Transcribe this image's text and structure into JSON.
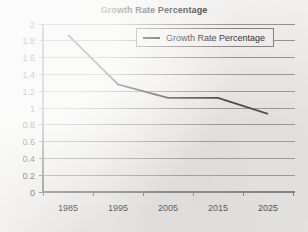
{
  "chart_data": {
    "type": "line",
    "title": "Growth Rate Percentage",
    "xlabel": "",
    "ylabel": "",
    "categories": [
      "1985",
      "1995",
      "2005",
      "2015",
      "2025"
    ],
    "series": [
      {
        "name": "Growth Rate Percentage",
        "values": [
          1.87,
          1.28,
          1.12,
          1.12,
          0.93
        ],
        "color": "#2a2a2a"
      }
    ],
    "ylim": [
      0,
      2
    ],
    "y_ticks": [
      "0",
      "0.2",
      "0.4",
      "0.6",
      "0.8",
      "1",
      "1.2",
      "1.4",
      "1.6",
      "1.8",
      "2"
    ],
    "grid": true,
    "legend": {
      "position": "top-center-inside",
      "entries": [
        {
          "label": "Growth Rate Percentage",
          "marker": "line-swatch"
        }
      ]
    },
    "colors": {
      "background": "#f1f0ee",
      "gridline": "#8f8f8f",
      "axis": "#6d6d6d",
      "text": "#1f1f1f",
      "series": "#2a2a2a"
    }
  }
}
